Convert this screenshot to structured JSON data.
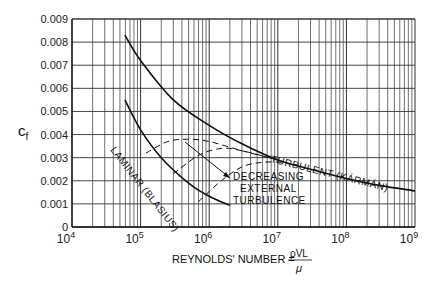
{
  "chart_data": {
    "type": "line",
    "title": "",
    "xlabel": "REYNOLDS' NUMBER = ρVL/μ",
    "ylabel": "Cf",
    "xscale": "log",
    "xlim": [
      10000,
      1000000000
    ],
    "ylim": [
      0,
      0.009
    ],
    "grid": true,
    "x_tick_labels": [
      "10^4",
      "10^5",
      "10^6",
      "10^7",
      "10^8",
      "10^9"
    ],
    "y_tick_labels": [
      "0",
      "0.001",
      "0.002",
      "0.003",
      "0.004",
      "0.005",
      "0.006",
      "0.007",
      "0.008",
      "0.009"
    ],
    "series": [
      {
        "name": "TURBULENT (KÁRMÁN)",
        "style": "solid",
        "x": [
          59000,
          100000,
          300000,
          1000000,
          3000000,
          10000000,
          30000000,
          100000000,
          300000000,
          1000000000
        ],
        "values": [
          0.0083,
          0.0072,
          0.0055,
          0.0044,
          0.0036,
          0.0029,
          0.0025,
          0.0021,
          0.0018,
          0.00156
        ]
      },
      {
        "name": "LAMINAR (BLASIUS)",
        "style": "solid",
        "x": [
          59000,
          100000,
          200000,
          500000,
          1000000,
          2000000
        ],
        "values": [
          0.0055,
          0.0042,
          0.003,
          0.0019,
          0.00133,
          0.00094
        ]
      },
      {
        "name": "transition (high external turbulence)",
        "style": "dashed",
        "x": [
          120000,
          250000,
          500000,
          1000000,
          3000000,
          10000000
        ],
        "values": [
          0.0032,
          0.0037,
          0.0038,
          0.0037,
          0.0033,
          0.0029
        ]
      },
      {
        "name": "transition (medium external turbulence)",
        "style": "dashed",
        "x": [
          300000,
          700000,
          1500000,
          3000000,
          10000000
        ],
        "values": [
          0.0023,
          0.0031,
          0.0034,
          0.0033,
          0.0029
        ]
      },
      {
        "name": "transition (low external turbulence)",
        "style": "dashed",
        "x": [
          700000,
          1500000,
          3000000,
          6000000,
          12000000
        ],
        "values": [
          0.0011,
          0.002,
          0.0026,
          0.0028,
          0.0028
        ]
      }
    ],
    "annotations": [
      {
        "text": "TURBULENT (KÁRMÁN)",
        "near": "upper curve, Re≈10^7–10^8"
      },
      {
        "text": "LAMINAR (BLASIUS)",
        "near": "lower curve, Re≈10^5–10^6"
      },
      {
        "text": "DECREASING EXTERNAL TURBULENCE",
        "arrow": "points down-right across dashed transition curves"
      }
    ]
  },
  "labels": {
    "ylabel_main": "c",
    "ylabel_sub": "f",
    "xlabel_prefix": "REYNOLDS' NUMBER =",
    "xlabel_num": "ρVL",
    "xlabel_den": "μ",
    "turbulent": "TURBULENT (KÁRMÁN)",
    "laminar": "LAMINAR (BLASIUS)",
    "decreasing_1": "DECREASING",
    "decreasing_2": "EXTERNAL",
    "decreasing_3": "TURBULENCE"
  }
}
